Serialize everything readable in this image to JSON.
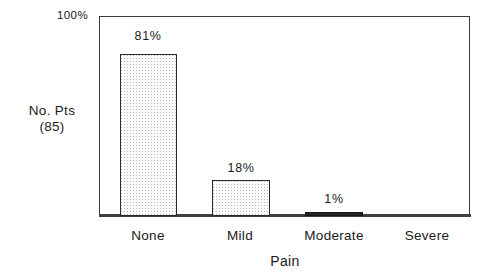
{
  "chart_data": {
    "type": "bar",
    "title": "",
    "subtitle": "",
    "xlabel": "Pain",
    "ylabel": "No. Pts (85)",
    "categories": [
      "None",
      "Mild",
      "Moderate",
      "Severe"
    ],
    "values": [
      81,
      18,
      1,
      0
    ],
    "value_labels": [
      "81%",
      "18%",
      "1%",
      ""
    ],
    "ylim": [
      0,
      100
    ],
    "y_tick_labels": [
      "100%"
    ],
    "y_unit": "%",
    "grid": false,
    "legend": "none",
    "bar_style": [
      "hatched",
      "hatched",
      "solid",
      "none"
    ],
    "n_patients": 85
  },
  "axes": {
    "y_top_tick": "100%",
    "y_label_line1": "No. Pts",
    "y_label_line2": "(85)",
    "x_title": "Pain"
  },
  "bars": [
    {
      "category": "None",
      "value": 81,
      "label": "81%"
    },
    {
      "category": "Mild",
      "value": 18,
      "label": "18%"
    },
    {
      "category": "Moderate",
      "value": 1,
      "label": "1%"
    },
    {
      "category": "Severe",
      "value": 0,
      "label": ""
    }
  ],
  "colors": {
    "frame": "#3a3a3a",
    "bar_border": "#2b2b2b",
    "bar_fill": "#f4f4f4",
    "bar_solid": "#262626",
    "text": "#1a1a1a",
    "background": "#ffffff"
  }
}
